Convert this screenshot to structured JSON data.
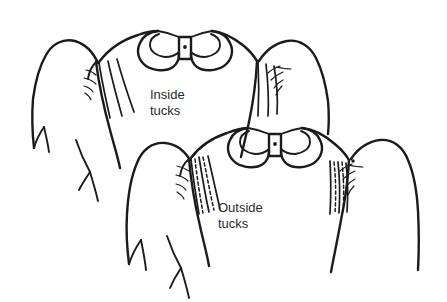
{
  "illustration": {
    "title": "Tucks construction diagram",
    "background_color": "#ffffff",
    "ink_color": "#1b1b1b",
    "text_color": "#2a2a2a",
    "style": "black-and-white line drawing"
  },
  "labels": {
    "upper": {
      "line1": "Inside",
      "line2": "tucks",
      "x": 150,
      "y": 99
    },
    "lower": {
      "line1": "Outside",
      "line2": "tucks",
      "x": 218,
      "y": 212
    }
  },
  "figures": [
    {
      "name": "inside-tucks-garment",
      "label": "Inside tucks",
      "tuck_style": "inside",
      "fold_lines": 3,
      "stitch_lines": 0,
      "collar": {
        "type": "peter-pan-collar",
        "center_band": true,
        "button_dot": true
      }
    },
    {
      "name": "outside-tucks-garment",
      "label": "Outside tucks",
      "tuck_style": "outside",
      "fold_lines": 3,
      "stitch_lines": 2,
      "collar": {
        "type": "peter-pan-collar",
        "center_band": true,
        "button_dot": true
      }
    }
  ]
}
